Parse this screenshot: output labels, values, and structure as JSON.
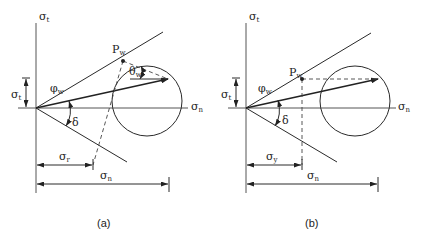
{
  "panels": [
    {
      "id": "a",
      "caption": "(a)",
      "labels": {
        "sigma_t_axis": {
          "base": "σ",
          "sub": "t"
        },
        "sigma_n_axis": {
          "base": "σ",
          "sub": "n"
        },
        "sigma_t_dim": {
          "base": "σ",
          "sub": "t"
        },
        "phi_w": {
          "base": "φ",
          "sub": "w"
        },
        "delta": {
          "base": "δ",
          "sub": ""
        },
        "p_w": {
          "base": "P",
          "sub": "w"
        },
        "theta_w": {
          "base": "θ",
          "sub": "w"
        },
        "sigma_lower_dim": {
          "base": "σ",
          "sub": "r"
        },
        "sigma_n_dim": {
          "base": "σ",
          "sub": "n"
        }
      }
    },
    {
      "id": "b",
      "caption": "(b)",
      "labels": {
        "sigma_t_axis": {
          "base": "σ",
          "sub": "t"
        },
        "sigma_n_axis": {
          "base": "σ",
          "sub": "n"
        },
        "sigma_t_dim": {
          "base": "σ",
          "sub": "t"
        },
        "phi_w": {
          "base": "φ",
          "sub": "w"
        },
        "delta": {
          "base": "δ",
          "sub": ""
        },
        "p_w": {
          "base": "P",
          "sub": "w"
        },
        "sigma_lower_dim": {
          "base": "σ",
          "sub": "y"
        },
        "sigma_n_dim": {
          "base": "σ",
          "sub": "n"
        }
      }
    }
  ]
}
